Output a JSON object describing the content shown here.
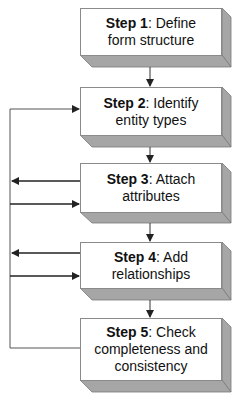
{
  "diagram": {
    "type": "flowchart",
    "colors": {
      "box_face": "#ffffff",
      "box_shadow": "#a6a6a6",
      "border": "#8a8a8a",
      "arrow": "#222222",
      "text": "#111111"
    },
    "steps": [
      {
        "label": "Step 1",
        "text": "Define form structure",
        "line1": ": Define",
        "line2": "form structure"
      },
      {
        "label": "Step 2",
        "text": "Identify entity types",
        "line1": ": Identify",
        "line2": "entity types"
      },
      {
        "label": "Step 3",
        "text": "Attach attributes",
        "line1": ": Attach",
        "line2": "attributes"
      },
      {
        "label": "Step 4",
        "text": "Add relationships",
        "line1": ": Add",
        "line2": "relationships"
      },
      {
        "label": "Step 5",
        "text": "Check completeness and consistency",
        "line1": ": Check",
        "line2": "completeness and",
        "line3": "consistency"
      }
    ],
    "connections": [
      {
        "from": "Step 1",
        "to": "Step 2",
        "kind": "sequential"
      },
      {
        "from": "Step 2",
        "to": "Step 3",
        "kind": "sequential"
      },
      {
        "from": "Step 3",
        "to": "Step 4",
        "kind": "sequential"
      },
      {
        "from": "Step 4",
        "to": "Step 5",
        "kind": "sequential"
      },
      {
        "from": "Step 5",
        "to": "Step 2",
        "kind": "feedback"
      },
      {
        "from": "Step 3",
        "to": "feedback-loop",
        "kind": "feedback"
      },
      {
        "from": "feedback-loop",
        "to": "Step 3",
        "kind": "feedback"
      },
      {
        "from": "Step 4",
        "to": "feedback-loop",
        "kind": "feedback"
      },
      {
        "from": "feedback-loop",
        "to": "Step 4",
        "kind": "feedback"
      }
    ]
  }
}
